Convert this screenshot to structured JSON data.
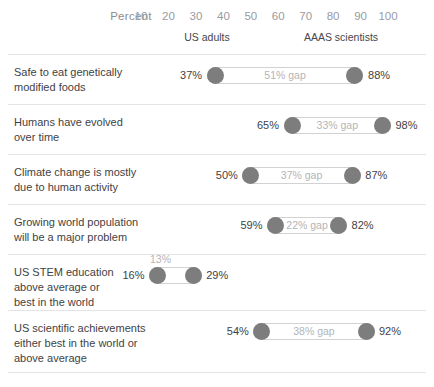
{
  "chart_data": {
    "type": "bar",
    "title": "",
    "subtitle": "",
    "xlabel": "Percent",
    "ylabel": "",
    "xlim": [
      0,
      100
    ],
    "xticks": [
      10,
      20,
      30,
      40,
      50,
      60,
      70,
      80,
      90,
      100
    ],
    "xtick_labels": [
      "10",
      "20",
      "30",
      "40",
      "50",
      "60",
      "70",
      "80",
      "90",
      "100"
    ],
    "grid": false,
    "legend_position": "top",
    "series": [
      {
        "name": "US adults",
        "values": [
          37,
          65,
          50,
          59,
          16,
          54
        ]
      },
      {
        "name": "AAAS scientists",
        "values": [
          88,
          98,
          87,
          82,
          29,
          92
        ]
      }
    ],
    "categories": [
      "Safe to eat genetically modified foods",
      "Humans have evolved over time",
      "Climate change is mostly due to human activity",
      "Growing world population will be a major problem",
      "US STEM education above average or best in the world",
      "US scientific achievements either best in the world or above average"
    ],
    "gaps": [
      51,
      33,
      37,
      22,
      13,
      38
    ],
    "annotations": [
      "51% gap",
      "33% gap",
      "37% gap",
      "22% gap",
      "13%",
      "38% gap"
    ]
  },
  "axis": {
    "title": "Percent",
    "title_x": 10,
    "ticks": [
      {
        "label": "10",
        "value": 10
      },
      {
        "label": "20",
        "value": 20
      },
      {
        "label": "30",
        "value": 30
      },
      {
        "label": "40",
        "value": 40
      },
      {
        "label": "50",
        "value": 50
      },
      {
        "label": "60",
        "value": 60
      },
      {
        "label": "70",
        "value": 70
      },
      {
        "label": "80",
        "value": 80
      },
      {
        "label": "90",
        "value": 90
      },
      {
        "label": "100",
        "value": 100
      }
    ]
  },
  "group_headers": [
    {
      "label": "US adults",
      "x": 207
    },
    {
      "label": "AAAS scientists",
      "x": 341
    }
  ],
  "rows": [
    {
      "label": "Safe to eat genetically modified foods",
      "label_lines": [
        "Safe to eat genetically",
        "modified foods"
      ],
      "left_value": 37,
      "right_value": 88,
      "left_label": "37%",
      "right_label": "88%",
      "gap_label": "51% gap",
      "gap_position": "inside"
    },
    {
      "label": "Humans have evolved over time",
      "label_lines": [
        "Humans have evolved",
        "over time"
      ],
      "left_value": 65,
      "right_value": 98,
      "left_label": "65%",
      "right_label": "98%",
      "gap_label": "33% gap",
      "gap_position": "inside"
    },
    {
      "label": "Climate change is mostly due to human activity",
      "label_lines": [
        "Climate change is mostly",
        "due to human activity"
      ],
      "left_value": 50,
      "right_value": 87,
      "left_label": "50%",
      "right_label": "87%",
      "gap_label": "37% gap",
      "gap_position": "inside"
    },
    {
      "label": "Growing world population will be a major problem",
      "label_lines": [
        "Growing world population",
        "will be a major problem"
      ],
      "left_value": 59,
      "right_value": 82,
      "left_label": "59%",
      "right_label": "82%",
      "gap_label": "22% gap",
      "gap_position": "inside"
    },
    {
      "label": "US STEM education above average or best in the world",
      "label_lines": [
        "US STEM education",
        "above average or",
        "best in the world"
      ],
      "left_value": 16,
      "right_value": 29,
      "left_label": "16%",
      "right_label": "29%",
      "gap_label": "13%",
      "gap_position": "above"
    },
    {
      "label": "US scientific achievements either best in the world or above average",
      "label_lines": [
        "US scientific achievements",
        "either best in the world or",
        "above average"
      ],
      "left_value": 54,
      "right_value": 92,
      "left_label": "54%",
      "right_label": "92%",
      "gap_label": "38% gap",
      "gap_position": "inside"
    }
  ],
  "colors": {
    "dot": "#7d7d7d",
    "track_border": "#d2d2d4",
    "rule": "#e4e4e6",
    "label_text": "#3f3f44",
    "tick_text": "#9a9a9f",
    "gap_text": "#b4b4b8",
    "background": "#ffffff"
  }
}
